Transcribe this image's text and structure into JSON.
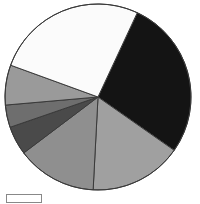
{
  "chart_data": {
    "type": "pie",
    "title": "",
    "subtitle": "",
    "xlabel": "",
    "ylabel": "",
    "grid": false,
    "legend_position": "bottom-left",
    "center": {
      "cx": 98,
      "cy": 97,
      "r": 93
    },
    "start_angle_deg": 25,
    "direction": "clockwise",
    "categories": [
      "Segment 1",
      "Segment 2",
      "Segment 3",
      "Segment 4",
      "Segment 5",
      "Segment 6",
      "Segment 7"
    ],
    "values": [
      28,
      16,
      14,
      5,
      4,
      7,
      26
    ],
    "colors": [
      "#141414",
      "#a0a0a0",
      "#8f8f8f",
      "#4a4a4a",
      "#6e6e6e",
      "#9a9a9a",
      "#fbfbfb"
    ],
    "slice_angles_deg": [
      100,
      58,
      50,
      18,
      14,
      25,
      95
    ],
    "slices": [
      {
        "label": "Segment 1",
        "value": 28,
        "color": "#141414",
        "angle_deg": 100
      },
      {
        "label": "Segment 2",
        "value": 16,
        "color": "#a0a0a0",
        "angle_deg": 58
      },
      {
        "label": "Segment 3",
        "value": 14,
        "color": "#8f8f8f",
        "angle_deg": 50
      },
      {
        "label": "Segment 4",
        "value": 5,
        "color": "#4a4a4a",
        "angle_deg": 18
      },
      {
        "label": "Segment 5",
        "value": 4,
        "color": "#6e6e6e",
        "angle_deg": 14
      },
      {
        "label": "Segment 6",
        "value": 7,
        "color": "#9a9a9a",
        "angle_deg": 25
      },
      {
        "label": "Segment 7",
        "value": 26,
        "color": "#fbfbfb",
        "angle_deg": 95
      }
    ],
    "stroke_color": "#3a3a3a",
    "stroke_width": 1,
    "background_color": "#ffffff"
  },
  "legend": {
    "swatch_color": "#ffffff",
    "swatch_border": "#888888",
    "label": ""
  }
}
